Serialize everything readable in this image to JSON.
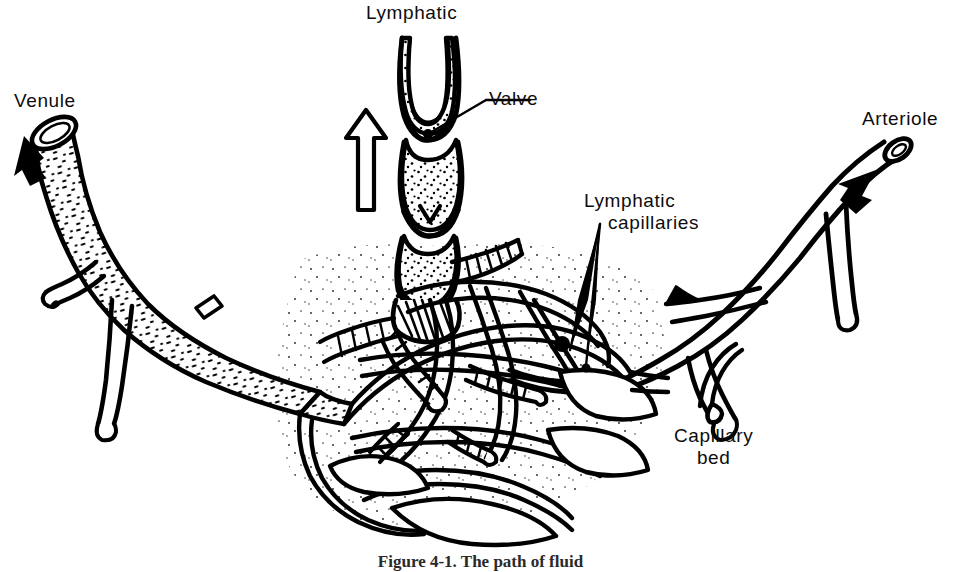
{
  "figure": {
    "background_color": "#ffffff",
    "ink_color": "#000000",
    "caption": "Figure 4-1. The path of fluid"
  },
  "labels": {
    "venule": "Venule",
    "lymphatic": "Lymphatic",
    "valve": "Valve",
    "arteriole": "Arteriole",
    "lymphatic_capillaries_line1": "Lymphatic",
    "lymphatic_capillaries_line2": "capillaries",
    "capillary_bed_line1": "Capillary",
    "capillary_bed_line2": "bed"
  },
  "flow_arrows": [
    {
      "name": "venule-flow-arrow",
      "direction": "up-left",
      "meaning": "blood leaving capillary bed toward venule"
    },
    {
      "name": "lymphatic-flow-arrow",
      "direction": "up",
      "meaning": "lymph flowing up the lymphatic vessel"
    },
    {
      "name": "arteriole-flow-arrow",
      "direction": "down-right",
      "meaning": "blood entering capillary bed from arteriole"
    }
  ],
  "structures": [
    {
      "name": "venule",
      "side": "left",
      "texture": "stippled-dashes"
    },
    {
      "name": "lymphatic-vessel",
      "side": "top-center",
      "texture": "fine-dots",
      "features": [
        "valve",
        "valve",
        "valve"
      ]
    },
    {
      "name": "arteriole",
      "side": "right",
      "texture": "plain-outline"
    },
    {
      "name": "capillary-bed",
      "side": "center",
      "texture": "dense-network"
    },
    {
      "name": "lymphatic-capillaries",
      "side": "center",
      "texture": "blind-ended-network"
    }
  ]
}
